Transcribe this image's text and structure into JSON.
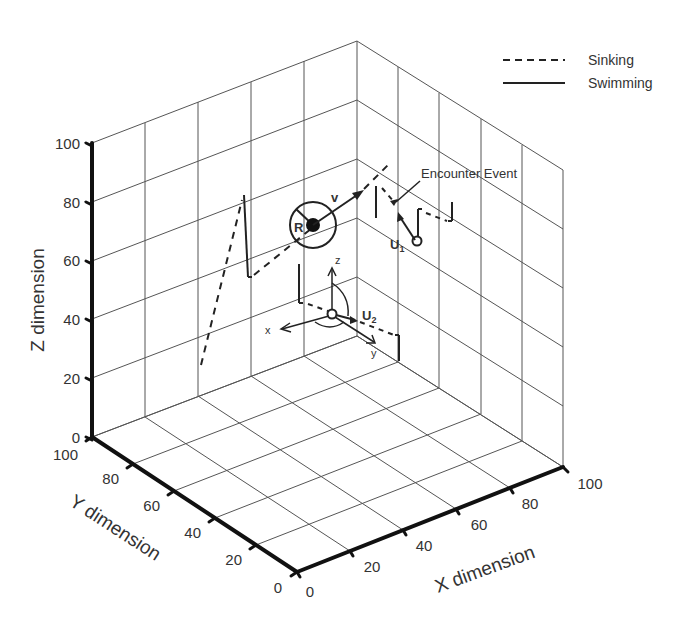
{
  "legend": {
    "items": [
      {
        "label": "Sinking",
        "style": "dashed"
      },
      {
        "label": "Swimming",
        "style": "solid"
      }
    ]
  },
  "axes": {
    "x": {
      "label": "X dimension",
      "ticks": [
        "0",
        "20",
        "40",
        "60",
        "80",
        "100"
      ]
    },
    "y": {
      "label": "Y dimension",
      "ticks": [
        "0",
        "20",
        "40",
        "60",
        "80",
        "100"
      ]
    },
    "z": {
      "label": "Z dimension",
      "ticks": [
        "0",
        "20",
        "40",
        "60",
        "80",
        "100"
      ]
    }
  },
  "annotations": {
    "encounter": "Encounter Event",
    "r_label": "R",
    "v_label": "v",
    "u1_main": "U",
    "u1_sub": "1",
    "u2_main": "U",
    "u2_sub": "2",
    "local_x": "x",
    "local_y": "y",
    "local_z": "z"
  },
  "colors": {
    "lines": "#222222",
    "grid": "#555555",
    "background": "#ffffff"
  }
}
